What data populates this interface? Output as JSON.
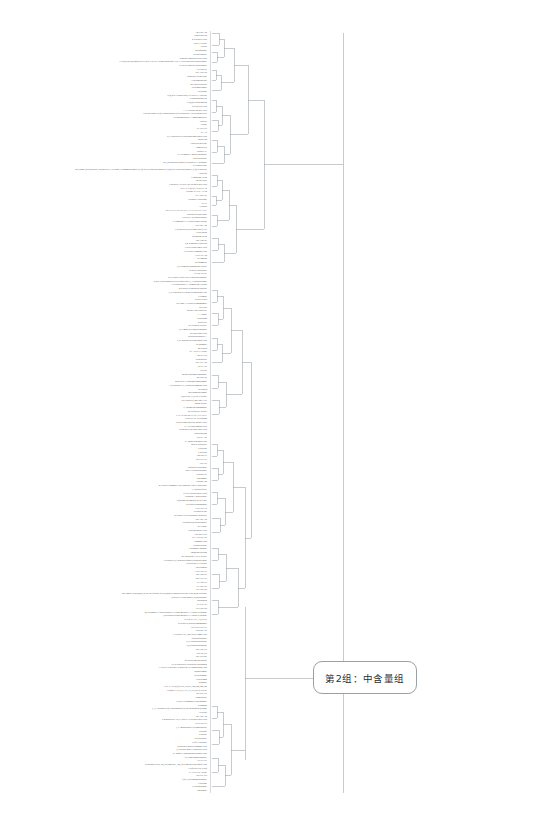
{
  "figure": {
    "type": "dendrogram",
    "title": "",
    "orientation": "horizontal-right",
    "background_color": "#ffffff",
    "line_color": "#9aa0a6",
    "label_color": "#4a4a4a"
  },
  "annotations": [
    {
      "id": "group-2",
      "text": "第2组：中含量组",
      "shape": "rounded-rectangle",
      "border_color": "#9aa0a6",
      "fill_color": "#ffffff",
      "x": 313,
      "y": 661,
      "width": 104,
      "height": 33
    }
  ],
  "chart_data": {
    "type": "tree",
    "title": "",
    "xlabel": "",
    "ylabel": "",
    "subtitle": "",
    "legend": [],
    "grid": false,
    "axis_visible": false,
    "leaf_count": 281,
    "leaf_labels": [
      "Arg-Gln-Asn",
      "Nigericin acid",
      "4-Pyridoxic acid",
      "Prolyl-Leucine",
      "Fucose",
      "Dopaquinone",
      "2-Propylmalate",
      "5-methyl-imidazoleacetic acid",
      "3-O-[(6R,8S,20,24)-4GalN-v23R-v-2-epi-3-alpha-spirostan-3-ol]-v-3-beta-glucoside-glucuronide",
      "Glyceryl-linoleate-glucuronide",
      "KLH43.23",
      "Abu-Asp-Gln",
      "Demethyl-cochlearine",
      "Fluorometholone",
      "4-Pyridoxolactone",
      "Oxolamin-amide",
      "Decarbine",
      "6-(2,2H7-Guanylethyl)-N-acetyl-L-cysteine",
      "Cephalosporin acid",
      "N-(2,4)-Sulfhydantoin",
      "D-Pipecolic acid",
      "L-7-Tyrosine methyl ester",
      "1-hexadecanoyl-2-(2'-alpha-glucosyl)-beta-glucosyl-3-beta-sn-glycerol",
      "N-Phosphoribosyl-L-aminoimidazole",
      "Uracitol",
      "Pterine",
      "Ile-Val-Glu",
      "Ile-Ala",
      "2,3-Dihydroxycyclopentaneundecanoic acid",
      "Isobutyrin",
      "Caprylosylglycine",
      "Campesterol",
      "Phaseol-13",
      "5-Acetamido-3-methylbutanoate",
      "Salicylaldehyde",
      "4-(3,4-Dihydroxyphenyl)-5-hydroxy-3-butanone",
      "D-valinebetaine",
      "MEH4241 (23R)-spirost-3en,5beta-ol-3-O-alpha-L-rhamnopyranosyl-(1,2)-beta-D-glucopyranoside-(1,4)-beta-D-glucopyranosyl-(1,4)-D-glucose",
      "Grucillin",
      "Compound 38.54",
      "Arg-Met-Met",
      "9-hydroxy-10-oxo-12Z-octadecenoic acid",
      "Ser-1-P-Co(II)/3-N-acetyl-18",
      "Lactone of PGF-AII.94",
      "Tyr-Arg-GlO",
      "Trephora Cyheptinge",
      "Ile-Ile",
      "Gelbach",
      "PKLV-6AZ-SE-GE-11ZA-SAZ-SE-GE-11ZV",
      "Dihydroferulohexanol",
      "Leucylic-3,4'-diglucuronide",
      "N-Jasmonoyl-L-Hydroxethine lactone",
      "Glu-Phe-Arg",
      "11-(Chloro-4E,23R-undecenyl)-v-ol",
      "Perezitinoln",
      "Spermidinepyrin",
      "Asn-Arg-Phe",
      "6,4'-Dimethoxyliquiritin",
      "3-oxo-tetradecanoyl acid",
      "13-Hydroxyjasmonic acid",
      "Lys-Leu-Arg",
      "Kellomaan",
      "Sulfonamides",
      "N,N-Dimethylsphingosine sulfate",
      "Hydroxyl-glucoside",
      "PGD2-GS101",
      "2-Cyclohexylethyl beta-D-glucopyranoside",
      "2-(sec-Chlorophenyl)-2-[cyclohexenyl]-1,3-dichloroethane",
      "N-tetradecanoyl-L-Homoserine lactone",
      "4-Hydroxy-6-methylpyridazine",
      "N,N-Dihydroxy-6-hydroxyandrostane acid",
      "Ceramine",
      "Salicylic acid",
      "4-Cyano-3-Hydroxycinnamamide",
      "Uric acid",
      "Methyl ethyl disulfide",
      "L-Alanine",
      "Hydrophan",
      "Reidvellol",
      "4'''-Hydroxyveratrile",
      "1,2-Amino-4-oxindolpentanone",
      "12-tridecenoic acid",
      "Dehydrosulphapyr-A",
      "9,10-dihydroxyoctadecanoic acid",
      "Hexanamide",
      "Mercaptin",
      "N7-Acetyl-L-lysine",
      "Thr-Ile-Glu",
      "Diadenoside",
      "Phe-Tyr-Arg",
      "Ala-Ile-Tyr",
      "Ser-Trp",
      "Methylcarbamoylphosphate",
      "Arg-Thr-His",
      "sn-glycero-3-Phosphoethanolamine",
      "1-(12-hydroxy-9,10-dihydrojasmonic acid",
      "Hyriopsin",
      "Ametadimethylamine",
      "Quercetin 3,7,8'-di-O-sulfate",
      "OCEDM-23E,24E-24Z-11D",
      "Santin acetate",
      "7'-Thiomethylsphinganine",
      "N2-Oxaloacyl acetate",
      "PAP-10-S23-4C7L-SE-17E-NE11",
      "N-acetyl-DL-tryptophan",
      "N-n-Decanoylglycine methyl ester",
      "N-Acetylneuraminic acid",
      "3R-hydroxy-hexadecenoic acid",
      "Schleroglucan",
      "Asp-Ile-Asp",
      "5-Amino-pentanoic acid",
      "Maleic hydrazide",
      "Prodilone",
      "Ciprolene",
      "Thr-Phe-Ile",
      "Sal-Gly-Gly",
      "Pro-Lys",
      "Dehydroxycarbonine",
      "ethyl-v-cephalosporanyl",
      "Lactone-D3",
      "Phloramine",
      "Lactone-D4",
      "4-Hydroxycinnamoyl-6,6'-dimethyl ether 7-glucoside",
      "7-Chlorocaffeate",
      "(3-oxo-octadecanoic acid)",
      "Carbinine-1-glucuronide",
      "2-(2-dimethylamino)-2-oxo-ethyl",
      "4-Hydroxysphinganine",
      "Gly-Glu-Glu",
      "Oxindol-2-one",
      "sec-Butyl-Hexylsulphonyl-Benzoate",
      "Phe-Thr-Arg",
      "3R-hydroxyheptadecanoate",
      "RG-14023",
      "Dehydrocholate acid",
      "Lau-Met-GlN",
      "Gly-Asp-Val-Val",
      "Cinnamic acid",
      "Oxadiazolidine",
      "Glutaminyl-arginine",
      "Anphalanexpropan",
      "M-Thiodione-7-oxyl acetate",
      "7-Hydroxy-2,3-dehydro-alpha-tetrachloroethane",
      "1,2-Dibydro-L-cysteine",
      "Phytolamine",
      "Cys-Lys-Gly",
      "Phe-Thr-Ser",
      "Phe-Gly-Gly",
      "Ile-Thr-Ser",
      "Ile-Thr-Tyr",
      "Lys-Thr-Thr",
      "MEH4209-18,20,24,27,27,27-hexafluoro-23,23,24,24-tetrahydroxyaerin-19-26,26,26-trifluoro",
      "1,2-beta-D-Glucuronosyl-D-glucuronate",
      "Phosphatin",
      "Ile-Glu-Tyr",
      "Lys-Thr-Thr",
      "4,6-Dibhano-3-Thienylarinoxy-3-alpha-methoxy-1-Thehyl-5-quinine",
      "3,4-Dichloro-alpha-methoxy-1-Thehyl-5-quinine",
      "PGG2-D-7-IC,Ail,OS-91",
      "4-Hydroxy-2-nitrocinnamamide",
      "Gly-Glu-Gly-Gly",
      "Gln-Phe-Lys",
      "7-Hydroxy-9E,14R-epoxy-imine acid",
      "Dihydrofuranose",
      "N,N'-DispiroBatalidine",
      "5,6-Dihydrothymidine",
      "Phe-Thr-Lys",
      "Thr-Val-Ser",
      "Phe-Val-Phe",
      "4-Hydroxymethylphenol",
      "15,16-Dihydro-6-Dehydroxycapsanthin",
      "1-Deoxy-D-glucose-D-galactose-D-isomaltosine acid",
      "Thymoxamine",
      "Tetracosamine",
      "Ceratolamin",
      "Hormone",
      "PGL-G-1SD(1)2-Seril,32,161,142,142,142,142",
      "Cys(24-SAZE,SE,11Z,11Z,19Z,21Z)-Nb121",
      "Thr-Ser-Leu",
      "Dimethoside",
      "1-Deoxy-D-mannitol-carbonamide",
      "Pregnanin",
      "1,1,1-Trichloro-2-(o-chlorophenyl)-2-(p-chlorophenyl)ethane",
      "Tetricine",
      "Asn-Asn-Arg",
      "9-hydroperoxy-12,13-epoxy-10-octadecenoic acid",
      "Leu-Cys-Gly",
      "1,3-Aminoadipate-6-semialdehyde",
      "Nikalone",
      "Fluorene",
      "2-Oxoadipate",
      "Coffee aldehyde",
      "3,4-Methylenedioxicinnamic acid",
      "1,6-Hepperidine-v-carboxylic acid",
      "2-Amino-3-phosphonopropanoic acid",
      "5-Cyanofuranpentanoate",
      "Ile-Ile-Gly",
      "Tridecanoic acid, 4,8,12-trimethyl-, 4,8,12-Trimethyltridecanoic acid",
      "Cer(d18:0/18: 0/O2)",
      "N-Acetyl-DL-valine",
      "Asp-Gly-Ser",
      "(3S)-3,4-Diaminobutanoate",
      "Cysteame",
      "Glucophosphine",
      "Rhizomide"
    ],
    "branch_color": "#9aa0a6",
    "root_x_px": 345,
    "leaf_x_px": 210,
    "plot_top_px": 31,
    "plot_bottom_px": 793
  }
}
